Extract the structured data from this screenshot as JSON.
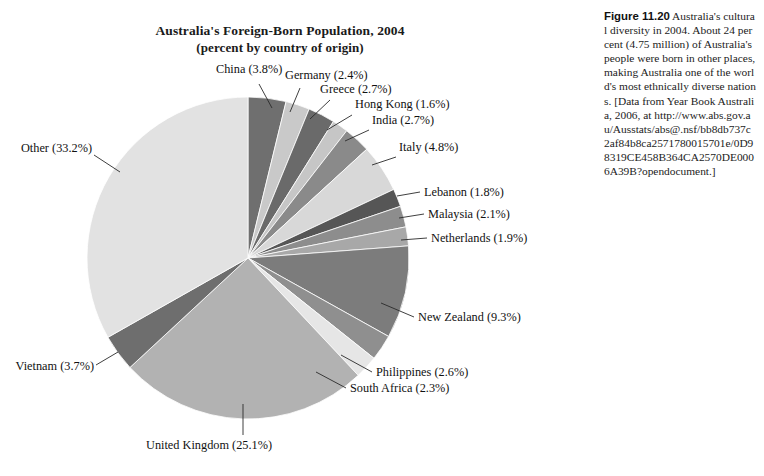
{
  "chart_data": {
    "type": "pie",
    "title": "Australia's Foreign-Born Population, 2004",
    "subtitle": "(percent by country of origin)",
    "unit": "percent",
    "legend": "none (direct labels with leader lines)",
    "start_angle_deg": 0,
    "direction": "clockwise",
    "categories": [
      "China",
      "Germany",
      "Greece",
      "Hong Kong",
      "India",
      "Italy",
      "Lebanon",
      "Malaysia",
      "Netherlands",
      "New Zealand",
      "Philippines",
      "South Africa",
      "United Kingdom",
      "Vietnam",
      "Other"
    ],
    "values": [
      3.8,
      2.4,
      2.7,
      1.6,
      2.7,
      4.8,
      1.8,
      2.1,
      1.9,
      9.3,
      2.6,
      2.3,
      25.1,
      3.7,
      33.2
    ],
    "slices": [
      {
        "label": "China (3.8%)",
        "name": "China",
        "value": 3.8,
        "color": "#6f6f6f"
      },
      {
        "label": "Germany (2.4%)",
        "name": "Germany",
        "value": 2.4,
        "color": "#c9c9c9"
      },
      {
        "label": "Greece (2.7%)",
        "name": "Greece",
        "value": 2.7,
        "color": "#6a6a6a"
      },
      {
        "label": "Hong Kong (1.6%)",
        "name": "Hong Kong",
        "value": 1.6,
        "color": "#c6c6c6"
      },
      {
        "label": "India (2.7%)",
        "name": "India",
        "value": 2.7,
        "color": "#8a8a8a"
      },
      {
        "label": "Italy (4.8%)",
        "name": "Italy",
        "value": 4.8,
        "color": "#d8d8d8"
      },
      {
        "label": "Lebanon (1.8%)",
        "name": "Lebanon",
        "value": 1.8,
        "color": "#565656"
      },
      {
        "label": "Malaysia (2.1%)",
        "name": "Malaysia",
        "value": 2.1,
        "color": "#8d8d8d"
      },
      {
        "label": "Netherlands (1.9%)",
        "name": "Netherlands",
        "value": 1.9,
        "color": "#a8a8a8"
      },
      {
        "label": "New Zealand (9.3%)",
        "name": "New Zealand",
        "value": 9.3,
        "color": "#7c7c7c"
      },
      {
        "label": "Philippines (2.6%)",
        "name": "Philippines",
        "value": 2.6,
        "color": "#8f8f8f"
      },
      {
        "label": "South Africa (2.3%)",
        "name": "South Africa",
        "value": 2.3,
        "color": "#e6e6e6"
      },
      {
        "label": "United Kingdom (25.1%)",
        "name": "United Kingdom",
        "value": 25.1,
        "color": "#b2b2b2"
      },
      {
        "label": "Vietnam (3.7%)",
        "name": "Vietnam",
        "value": 3.7,
        "color": "#6e6e6e"
      },
      {
        "label": "Other (33.2%)",
        "name": "Other",
        "value": 33.2,
        "color": "#e2e2e2"
      }
    ]
  },
  "caption": {
    "figure_number": "Figure 11.20",
    "text": "Australia's cultural diversity in 2004. About 24 percent (4.75 million) of Australia's people were born in other places, making Australia one of the world's most ethnically diverse nations. [Data from Year Book Australia, 2006, at http://www.abs.gov.au/Ausstats/abs@.nsf/bb8db737c2af84b8ca2571780015701e/0D98319CE458B364CA2570DE0006A39B?opendocument.]"
  }
}
